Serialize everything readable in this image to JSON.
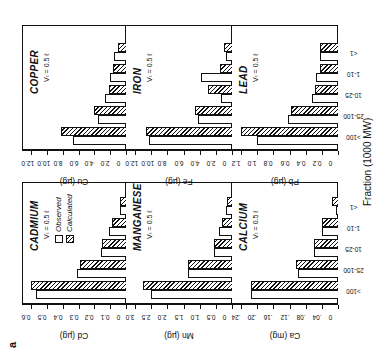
{
  "figure_label": "a",
  "x_axis_title": "Fraction (1000 MW)",
  "legend": {
    "observed": "Observed",
    "calculated": "Calculated"
  },
  "categories": [
    ">100",
    "25-100",
    "10-25",
    "1-10",
    "<1"
  ],
  "chart_data": [
    {
      "type": "bar",
      "title": "CADMIUM",
      "subtitle": "Vₜ = 0.5 ℓ",
      "ylabel": "Cd (µg)",
      "ylim": [
        0,
        0.6
      ],
      "yticks": [
        "0",
        "0.1",
        "0.2",
        "0.3",
        "0.4",
        "0.5",
        "0.6"
      ],
      "categories": [
        ">100",
        "25-100",
        "10-25",
        "1-10",
        "<1"
      ],
      "series": [
        {
          "name": "Observed",
          "values": [
            0.57,
            0.31,
            0.16,
            0.11,
            0.04
          ]
        },
        {
          "name": "Calculated",
          "values": [
            0.6,
            0.29,
            0.15,
            0.09,
            0.04
          ]
        }
      ]
    },
    {
      "type": "bar",
      "title": "COPPER",
      "subtitle": "Vₜ = 0.5 ℓ",
      "ylabel": "Cu (µg)",
      "ylim": [
        0,
        12.0
      ],
      "yticks": [
        "0",
        "2.0",
        "4.0",
        "6.0",
        "8.0",
        "10.0",
        "12.0"
      ],
      "categories": [
        ">100",
        "25-100",
        "10-25",
        "1-10",
        "<1"
      ],
      "series": [
        {
          "name": "Observed",
          "values": [
            6.7,
            3.6,
            2.6,
            2.0,
            1.5
          ]
        },
        {
          "name": "Calculated",
          "values": [
            8.2,
            4.0,
            2.2,
            1.7,
            1.0
          ]
        }
      ]
    },
    {
      "type": "bar",
      "title": "MANGANESE",
      "subtitle": "Vₜ = 0.5 ℓ",
      "ylabel": "Mn (µg)",
      "ylim": [
        0,
        3.0
      ],
      "yticks": [
        "0",
        "0.5",
        "1.0",
        "1.5",
        "2.0",
        "2.5",
        "3.0"
      ],
      "categories": [
        ">100",
        "25-100",
        "10-25",
        "1-10",
        "<1"
      ],
      "series": [
        {
          "name": "Observed",
          "values": [
            2.5,
            1.35,
            0.55,
            0.4,
            0.2
          ]
        },
        {
          "name": "Calculated",
          "values": [
            2.75,
            1.35,
            0.55,
            0.3,
            0.15
          ]
        }
      ]
    },
    {
      "type": "bar",
      "title": "IRON",
      "subtitle": "Vₜ = 0.5 ℓ",
      "ylabel": "Fe (µg)",
      "ylim": [
        0,
        12.0
      ],
      "yticks": [
        "0",
        "2.0",
        "4.0",
        "6.0",
        "8.0",
        "10.0",
        "12.0"
      ],
      "categories": [
        ">100",
        "25-100",
        "10-25",
        "1-10",
        "<1"
      ],
      "series": [
        {
          "name": "Observed",
          "values": [
            10.3,
            4.2,
            1.4,
            3.8,
            0.7
          ]
        },
        {
          "name": "Calculated",
          "values": [
            10.7,
            4.6,
            3.0,
            1.5,
            1.0
          ]
        }
      ]
    },
    {
      "type": "bar",
      "title": "CALCIUM",
      "subtitle": "Vₜ = 0.5 ℓ",
      "ylabel": "Ca (mg)",
      "ylim": [
        0,
        0.24
      ],
      "yticks": [
        "0",
        ".04",
        ".08",
        ".12",
        ".16",
        ".20",
        ".24"
      ],
      "categories": [
        ">100",
        "25-100",
        "10-25",
        "1-10",
        "<1"
      ],
      "series": [
        {
          "name": "Observed",
          "values": [
            0.215,
            0.1,
            0.06,
            0.04,
            0.005
          ]
        },
        {
          "name": "Calculated",
          "values": [
            0.215,
            0.105,
            0.06,
            0.04,
            0.015
          ]
        }
      ]
    },
    {
      "type": "bar",
      "title": "LEAD",
      "subtitle": "Vₜ = 0.5 ℓ",
      "ylabel": "Pb (µg)",
      "ylim": [
        0,
        1.2
      ],
      "yticks": [
        "0",
        "0.2",
        "0.4",
        "0.6",
        "0.8",
        "1.0",
        "1.2"
      ],
      "categories": [
        ">100",
        "25-100",
        "10-25",
        "1-10",
        "<1"
      ],
      "series": [
        {
          "name": "Observed",
          "values": [
            1.0,
            0.62,
            0.32,
            0.27,
            0.22
          ]
        },
        {
          "name": "Calculated",
          "values": [
            1.2,
            0.58,
            0.29,
            0.22,
            0.22
          ]
        }
      ]
    }
  ]
}
